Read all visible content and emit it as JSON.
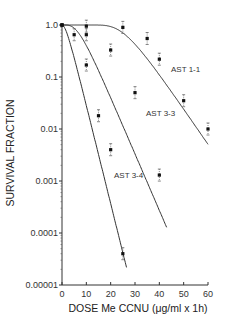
{
  "chart_data": {
    "type": "line",
    "title": "",
    "xlabel": "DOSE Me CCNU (μg/ml x 1h)",
    "ylabel": "SURVIVAL FRACTION",
    "xlim": [
      0,
      60
    ],
    "ylim": [
      1e-05,
      1.0
    ],
    "yscale": "log",
    "grid": false,
    "legend": "inline labels",
    "x_ticks": [
      "0",
      "10",
      "20",
      "30",
      "40",
      "50",
      "60"
    ],
    "y_ticks": [
      "1.0",
      "0.1",
      "0.01",
      "0.001",
      "0.0001",
      "0.00001"
    ],
    "series": [
      {
        "name": "AST 1-1",
        "points": [
          {
            "x": 0,
            "y": 1.0
          },
          {
            "x": 10,
            "y": 0.95
          },
          {
            "x": 25,
            "y": 0.9
          },
          {
            "x": 35,
            "y": 0.55
          },
          {
            "x": 40,
            "y": 0.22
          },
          {
            "x": 50,
            "y": 0.035
          },
          {
            "x": 60,
            "y": 0.01
          }
        ]
      },
      {
        "name": "AST 3-3",
        "points": [
          {
            "x": 0,
            "y": 1.0
          },
          {
            "x": 10,
            "y": 0.65
          },
          {
            "x": 20,
            "y": 0.33
          },
          {
            "x": 30,
            "y": 0.05
          },
          {
            "x": 40,
            "y": 0.0013
          }
        ]
      },
      {
        "name": "AST 3-4",
        "points": [
          {
            "x": 0,
            "y": 1.0
          },
          {
            "x": 5,
            "y": 0.65
          },
          {
            "x": 10,
            "y": 0.17
          },
          {
            "x": 15,
            "y": 0.018
          },
          {
            "x": 20,
            "y": 0.004
          },
          {
            "x": 25,
            "y": 4e-05
          }
        ]
      }
    ]
  },
  "labels": {
    "xlabel": "DOSE Me CCNU (μg/ml x 1h)",
    "ylabel": "SURVIVAL FRACTION",
    "series": [
      "AST 1-1",
      "AST 3-3",
      "AST 3-4"
    ]
  }
}
